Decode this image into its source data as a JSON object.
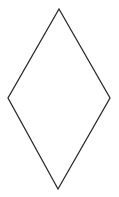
{
  "diagram": {
    "shape": "diamond",
    "background": "#ffffff",
    "stroke": "#2b2b2b",
    "fill": "#ffffff",
    "stroke_width": 1.3,
    "vertices": {
      "top": [
        59,
        9
      ],
      "right": [
        110,
        98
      ],
      "bottom": [
        58,
        189
      ],
      "left": [
        8,
        98
      ]
    }
  }
}
